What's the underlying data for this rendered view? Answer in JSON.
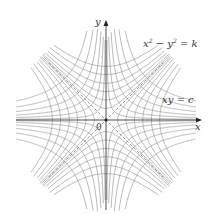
{
  "figure": {
    "type": "level-curves",
    "origin_px": [
      106,
      120
    ],
    "scale_px": 30,
    "extent_px": 90,
    "colors": {
      "curve": "#8a8a8a",
      "axis": "#222222",
      "asymptote": "#555555",
      "text": "#333333"
    }
  },
  "families": [
    {
      "name": "hyperbola-difference",
      "equation": "x² − y² = k",
      "k_values": [
        0.15,
        0.45,
        0.9,
        1.5,
        2.3,
        3.2
      ]
    },
    {
      "name": "hyperbola-product",
      "equation": "xy = c",
      "c_values": [
        0.08,
        0.25,
        0.5,
        0.85,
        1.3,
        1.9
      ]
    }
  ],
  "labels": {
    "eq1_lhs_x": "x",
    "eq1_exp1": "2",
    "eq1_minus": " − ",
    "eq1_y": "y",
    "eq1_exp2": "2",
    "eq1_rhs": " = k",
    "eq2": "xy = c",
    "x_axis": "x",
    "y_axis": "y",
    "origin": "0"
  }
}
